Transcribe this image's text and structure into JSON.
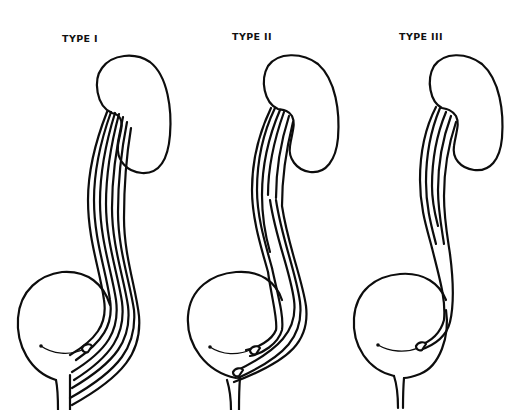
{
  "figure": {
    "panels": [
      {
        "label": "TYPE I"
      },
      {
        "label": "TYPE II"
      },
      {
        "label": "TYPE III"
      }
    ],
    "line_color": "#0d0d0d",
    "background_color": "#ffffff"
  }
}
